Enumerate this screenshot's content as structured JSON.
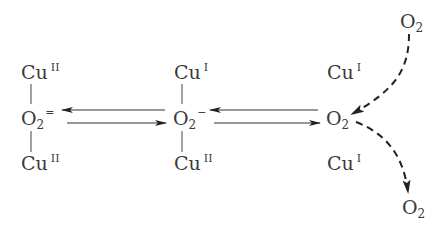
{
  "diagram": {
    "type": "oxygen exchange mechanism on copper sites",
    "species": {
      "left": {
        "top": {
          "base": "Cu",
          "sup": "II"
        },
        "center": {
          "base": "O",
          "sub": "2",
          "sup": "="
        },
        "bottom": {
          "base": "Cu",
          "sup": "II"
        }
      },
      "middle": {
        "top": {
          "base": "Cu",
          "sup": "I"
        },
        "center": {
          "base": "O",
          "sub": "2",
          "sup": "−"
        },
        "bottom": {
          "base": "Cu",
          "sup": "II"
        }
      },
      "right": {
        "top": {
          "base": "Cu",
          "sup": "I"
        },
        "center": {
          "base": "O",
          "sub": "2",
          "sup": ""
        },
        "bottom": {
          "base": "Cu",
          "sup": "I"
        }
      },
      "gas_in": {
        "base": "O",
        "sub": "2"
      },
      "gas_out": {
        "base": "O",
        "sub": "2"
      }
    },
    "arrows": [
      {
        "from": "middle.center",
        "to": "left.center",
        "style": "solid",
        "direction": "left"
      },
      {
        "from": "left.center",
        "to": "middle.center",
        "style": "solid",
        "direction": "right"
      },
      {
        "from": "right.center",
        "to": "middle.center",
        "style": "solid",
        "direction": "left"
      },
      {
        "from": "middle.center",
        "to": "right.center",
        "style": "solid",
        "direction": "right"
      },
      {
        "from": "gas_in",
        "to": "right.center",
        "style": "dashed-curve"
      },
      {
        "from": "right.center",
        "to": "gas_out",
        "style": "dashed-curve"
      }
    ],
    "colors": {
      "text": "#3a3a3a",
      "lines": "#333333",
      "background": "#ffffff"
    }
  }
}
